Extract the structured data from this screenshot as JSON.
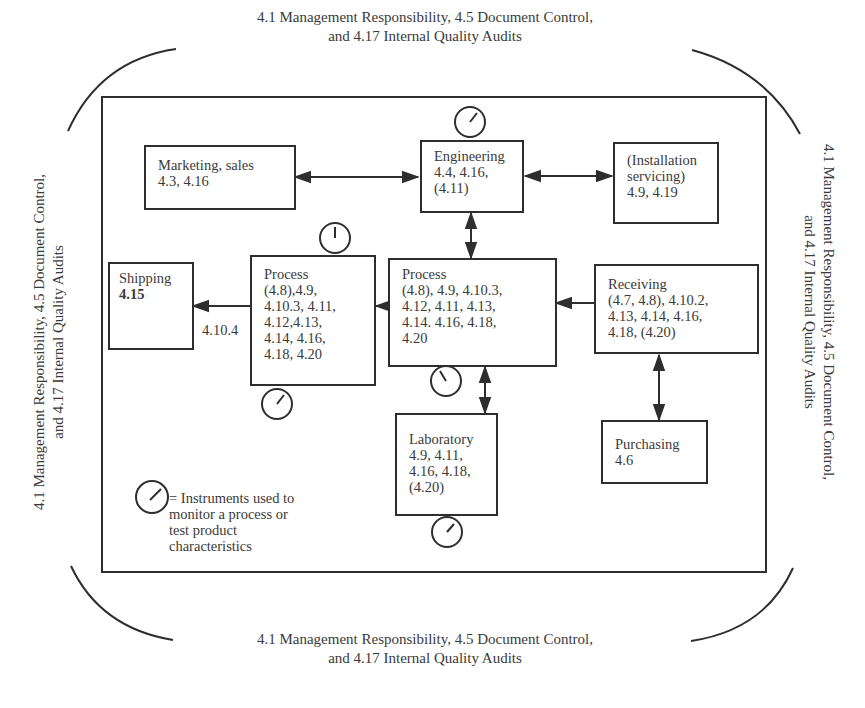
{
  "frame_captions": {
    "top": {
      "line1": "4.1 Management Responsibility, 4.5 Document Control,",
      "line2": "and 4.17 Internal Quality Audits"
    },
    "bottom": {
      "line1": "4.1 Management Responsibility, 4.5 Document Control,",
      "line2": "and 4.17 Internal Quality Audits"
    },
    "left": {
      "line1": "4.1 Management Responsibility, 4.5 Document Control,",
      "line2": "and 4.17 Internal Quality Audits"
    },
    "right": {
      "line1": "4.1 Management Responsibility, 4.5 Document Control,",
      "line2": "and 4.17 Internal Quality Audits"
    }
  },
  "nodes": {
    "marketing": {
      "title": "Marketing, sales",
      "clauses": "4.3, 4.16"
    },
    "engineering": {
      "title": "Engineering",
      "clauses": "4.4, 4.16,\n(4.11)"
    },
    "installation": {
      "title": "(Installation\nservicing)",
      "clauses": "4.9, 4.19"
    },
    "shipping": {
      "title": "Shipping",
      "clauses": "4.15"
    },
    "process_final": {
      "title": "Process",
      "clauses": "(4.8),4.9,\n4.10.3, 4.11,\n4.12,4.13,\n4.14, 4.16,\n4.18, 4.20"
    },
    "process_main": {
      "title": "Process",
      "clauses": "(4.8), 4.9, 4.10.3,\n4.12, 4.11, 4.13,\n4.14. 4.16, 4.18,\n4.20"
    },
    "receiving": {
      "title": "Receiving",
      "clauses": "(4.7, 4.8), 4.10.2,\n4.13, 4.14, 4.16,\n4.18, (4.20)"
    },
    "laboratory": {
      "title": "Laboratory",
      "clauses": "4.9, 4.11,\n4.16,  4.18,\n(4.20)"
    },
    "purchasing": {
      "title": "Purchasing",
      "clauses": "4.6"
    }
  },
  "edge_labels": {
    "process_to_shipping": "4.10.4"
  },
  "legend": {
    "icon": "instrument-dial-icon",
    "text": "= Instruments used to\nmonitor a process or\ntest product\ncharacteristics"
  },
  "colors": {
    "line": "#2e2e2e",
    "text": "#3a3a3a",
    "background": "#ffffff"
  }
}
